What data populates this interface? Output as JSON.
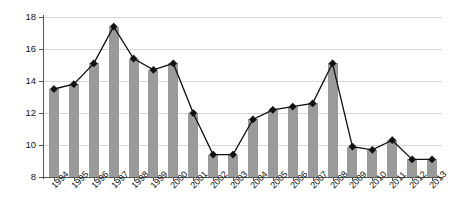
{
  "chart_data": {
    "type": "bar",
    "title": "",
    "subtitle": "",
    "xlabel": "",
    "ylabel": "",
    "ylim": [
      8,
      18
    ],
    "yticks": [
      8,
      10,
      12,
      14,
      16,
      18
    ],
    "grid": true,
    "legend": "none",
    "marker_overlay": "line-with-diamond-markers",
    "categories": [
      "1994",
      "1995",
      "1996",
      "1997",
      "1998",
      "1999",
      "2000",
      "2001",
      "2002",
      "2003",
      "2004",
      "2005",
      "2006",
      "2007",
      "2008",
      "2009",
      "2010",
      "2011",
      "2012",
      "2013"
    ],
    "values": [
      13.5,
      13.8,
      15.1,
      17.4,
      15.4,
      14.7,
      15.1,
      12.0,
      9.4,
      9.4,
      11.6,
      12.2,
      12.4,
      12.6,
      15.1,
      9.9,
      9.7,
      10.3,
      9.1,
      9.1
    ],
    "series": [
      {
        "name": "series-1",
        "values": [
          13.5,
          13.8,
          15.1,
          17.4,
          15.4,
          14.7,
          15.1,
          12.0,
          9.4,
          9.4,
          11.6,
          12.2,
          12.4,
          12.6,
          15.1,
          9.9,
          9.7,
          10.3,
          9.1,
          9.1
        ]
      }
    ],
    "colors": {
      "bar": "#9a9a9a",
      "line": "#111111",
      "marker": "#111111",
      "grid": "#d6d6d6",
      "axis": "#555555",
      "background": "#ffffff"
    }
  }
}
